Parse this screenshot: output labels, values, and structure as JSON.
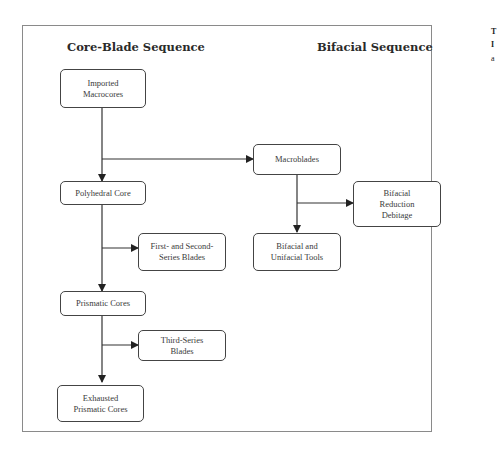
{
  "headings": {
    "left": "Core-Blade Sequence",
    "right": "Bifacial Sequence"
  },
  "nodes": {
    "imported_macrocores": "Imported\nMacrocores",
    "polyhedral_core": "Polyhedral Core",
    "first_second_series_blades": "First- and Second-\nSeries Blades",
    "prismatic_cores": "Prismatic Cores",
    "third_series_blades": "Third-Series\nBlades",
    "exhausted_prismatic_cores": "Exhausted\nPrismatic Cores",
    "macroblades": "Macroblades",
    "bifacial_reduction_debitage": "Bifacial\nReduction\nDebitage",
    "bifacial_unifacial_tools": "Bifacial and\nUnifacial Tools"
  },
  "edges": [
    {
      "from": "Imported Macrocores",
      "to": "Polyhedral Core"
    },
    {
      "from": "Imported Macrocores",
      "to": "Macroblades"
    },
    {
      "from": "Polyhedral Core",
      "to": "First- and Second-Series Blades"
    },
    {
      "from": "Polyhedral Core",
      "to": "Prismatic Cores"
    },
    {
      "from": "Prismatic Cores",
      "to": "Third-Series Blades"
    },
    {
      "from": "Prismatic Cores",
      "to": "Exhausted Prismatic Cores"
    },
    {
      "from": "Macroblades",
      "to": "Bifacial Reduction Debitage"
    },
    {
      "from": "Macroblades",
      "to": "Bifacial and Unifacial Tools"
    }
  ],
  "clipped_margin_text": [
    "T",
    "I",
    "a"
  ]
}
